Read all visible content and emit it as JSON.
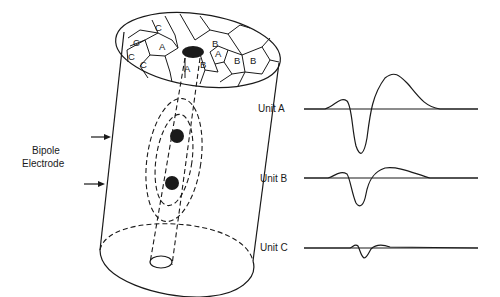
{
  "figure": {
    "side_label_line1": "Bipole",
    "side_label_line2": "Electrode",
    "territory_labels": [
      "C",
      "C",
      "C",
      "C",
      "A",
      "A",
      "A",
      "B",
      "B",
      "B",
      "B"
    ],
    "units": [
      {
        "label": "Unit A",
        "relative_amplitude": 1.0
      },
      {
        "label": "Unit B",
        "relative_amplitude": 0.6
      },
      {
        "label": "Unit C",
        "relative_amplitude": 0.2
      }
    ],
    "colors": {
      "ink": "#1a1a1a",
      "background": "#ffffff"
    }
  }
}
